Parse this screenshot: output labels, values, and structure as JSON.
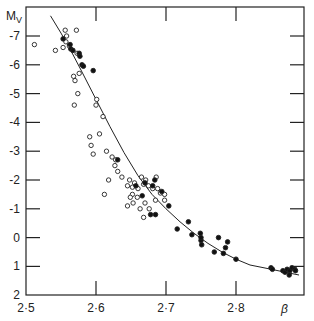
{
  "chart_data": {
    "type": "scatter",
    "title": "",
    "xlabel": "β",
    "ylabel": "M_V",
    "xlim": [
      2.5,
      2.897
    ],
    "ylim": [
      2,
      -7.7
    ],
    "x_ticks": [
      "2·5",
      "2·6",
      "2·7",
      "2·8"
    ],
    "y_ticks": [
      "-7",
      "-6",
      "-5",
      "-4",
      "-3",
      "-2",
      "-1",
      "0",
      "1",
      "2"
    ],
    "grid": false,
    "series": [
      {
        "name": "open circles",
        "marker": "open-circle",
        "points": [
          [
            2.512,
            -6.7
          ],
          [
            2.542,
            -6.5
          ],
          [
            2.553,
            -6.6
          ],
          [
            2.556,
            -7.2
          ],
          [
            2.557,
            -6.8
          ],
          [
            2.558,
            -7.0
          ],
          [
            2.572,
            -7.2
          ],
          [
            2.573,
            -6.4
          ],
          [
            2.562,
            -6.65
          ],
          [
            2.568,
            -5.6
          ],
          [
            2.576,
            -5.7
          ],
          [
            2.57,
            -5.45
          ],
          [
            2.574,
            -5.0
          ],
          [
            2.569,
            -4.6
          ],
          [
            2.601,
            -4.8
          ],
          [
            2.6,
            -4.6
          ],
          [
            2.61,
            -4.2
          ],
          [
            2.605,
            -3.6
          ],
          [
            2.591,
            -3.5
          ],
          [
            2.593,
            -3.2
          ],
          [
            2.596,
            -2.9
          ],
          [
            2.615,
            -3.0
          ],
          [
            2.623,
            -2.8
          ],
          [
            2.628,
            -2.7
          ],
          [
            2.627,
            -2.5
          ],
          [
            2.631,
            -2.3
          ],
          [
            2.637,
            -2.1
          ],
          [
            2.618,
            -2.0
          ],
          [
            2.612,
            -1.5
          ],
          [
            2.648,
            -2.0
          ],
          [
            2.655,
            -1.9
          ],
          [
            2.66,
            -1.7
          ],
          [
            2.645,
            -1.8
          ],
          [
            2.652,
            -1.5
          ],
          [
            2.659,
            -1.4
          ],
          [
            2.649,
            -1.4
          ],
          [
            2.645,
            -1.1
          ],
          [
            2.653,
            -1.2
          ],
          [
            2.663,
            -1.0
          ],
          [
            2.67,
            -1.2
          ],
          [
            2.668,
            -0.7
          ],
          [
            2.676,
            -1.0
          ],
          [
            2.665,
            -2.1
          ],
          [
            2.671,
            -2.0
          ],
          [
            2.675,
            -1.8
          ],
          [
            2.688,
            -1.7
          ],
          [
            2.692,
            -1.55
          ],
          [
            2.698,
            -1.5
          ],
          [
            2.685,
            -1.3
          ],
          [
            2.681,
            -1.7
          ],
          [
            2.668,
            -1.85
          ],
          [
            2.686,
            -2.1
          ],
          [
            2.698,
            -1.3
          ],
          [
            2.652,
            -1.75
          ]
        ]
      },
      {
        "name": "filled circles",
        "marker": "filled-circle",
        "points": [
          [
            2.553,
            -6.9
          ],
          [
            2.563,
            -6.7
          ],
          [
            2.564,
            -6.55
          ],
          [
            2.567,
            -6.5
          ],
          [
            2.576,
            -6.4
          ],
          [
            2.577,
            -6.3
          ],
          [
            2.58,
            -6.0
          ],
          [
            2.596,
            -5.8
          ],
          [
            2.582,
            -5.95
          ],
          [
            2.631,
            -2.7
          ],
          [
            2.657,
            -1.8
          ],
          [
            2.67,
            -1.9
          ],
          [
            2.681,
            -1.8
          ],
          [
            2.684,
            -2.0
          ],
          [
            2.666,
            -1.45
          ],
          [
            2.694,
            -1.6
          ],
          [
            2.678,
            -0.8
          ],
          [
            2.685,
            -0.8
          ],
          [
            2.704,
            -1.1
          ],
          [
            2.716,
            -0.3
          ],
          [
            2.732,
            -0.55
          ],
          [
            2.737,
            -0.1
          ],
          [
            2.749,
            -0.15
          ],
          [
            2.75,
            0.1
          ],
          [
            2.751,
            0.25
          ],
          [
            2.75,
            0.0
          ],
          [
            2.769,
            0.5
          ],
          [
            2.775,
            0.0
          ],
          [
            2.785,
            0.35
          ],
          [
            2.788,
            0.15
          ],
          [
            2.782,
            0.55
          ],
          [
            2.8,
            0.75
          ],
          [
            2.85,
            1.05
          ],
          [
            2.852,
            1.1
          ],
          [
            2.867,
            1.15
          ],
          [
            2.87,
            1.2
          ],
          [
            2.873,
            1.1
          ],
          [
            2.877,
            1.15
          ],
          [
            2.88,
            1.05
          ],
          [
            2.884,
            1.1
          ],
          [
            2.876,
            1.3
          ],
          [
            2.885,
            1.15
          ]
        ]
      },
      {
        "name": "fitted curve",
        "marker": "line",
        "points": [
          [
            2.535,
            -7.7
          ],
          [
            2.55,
            -7.1
          ],
          [
            2.565,
            -6.45
          ],
          [
            2.58,
            -5.75
          ],
          [
            2.6,
            -4.8
          ],
          [
            2.62,
            -3.85
          ],
          [
            2.64,
            -2.95
          ],
          [
            2.66,
            -2.15
          ],
          [
            2.68,
            -1.5
          ],
          [
            2.7,
            -1.0
          ],
          [
            2.72,
            -0.55
          ],
          [
            2.74,
            -0.15
          ],
          [
            2.76,
            0.2
          ],
          [
            2.78,
            0.5
          ],
          [
            2.8,
            0.75
          ],
          [
            2.82,
            0.95
          ],
          [
            2.84,
            1.05
          ],
          [
            2.86,
            1.15
          ],
          [
            2.88,
            1.25
          ],
          [
            2.89,
            1.3
          ]
        ]
      }
    ]
  }
}
